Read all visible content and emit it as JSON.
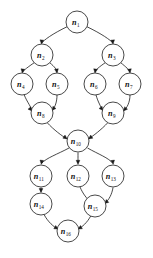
{
  "figure": {
    "header_text": "",
    "background_color": "#ffffff",
    "stroke_color": "#1a1a1a",
    "label_color": "#111111",
    "node_radius": 11,
    "width": 153,
    "height": 258
  },
  "chart_data": {
    "type": "diagram",
    "subtype": "directed-acyclic-graph",
    "directed": true,
    "node_count": 16,
    "edge_count": 18,
    "nodes": [
      {
        "id": "n1",
        "label_base": "n",
        "label_sub": "1",
        "x": 77,
        "y": 22
      },
      {
        "id": "n2",
        "label_base": "n",
        "label_sub": "2",
        "x": 42,
        "y": 55
      },
      {
        "id": "n3",
        "label_base": "n",
        "label_sub": "3",
        "x": 113,
        "y": 55
      },
      {
        "id": "n4",
        "label_base": "n",
        "label_sub": "4",
        "x": 22,
        "y": 84
      },
      {
        "id": "n5",
        "label_base": "n",
        "label_sub": "5",
        "x": 57,
        "y": 84
      },
      {
        "id": "n6",
        "label_base": "n",
        "label_sub": "6",
        "x": 95,
        "y": 84
      },
      {
        "id": "n7",
        "label_base": "n",
        "label_sub": "7",
        "x": 130,
        "y": 84
      },
      {
        "id": "n8",
        "label_base": "n",
        "label_sub": "8",
        "x": 42,
        "y": 113
      },
      {
        "id": "n9",
        "label_base": "n",
        "label_sub": "9",
        "x": 113,
        "y": 113
      },
      {
        "id": "n10",
        "label_base": "n",
        "label_sub": "10",
        "x": 78,
        "y": 141
      },
      {
        "id": "n11",
        "label_base": "n",
        "label_sub": "11",
        "x": 41,
        "y": 176
      },
      {
        "id": "n12",
        "label_base": "n",
        "label_sub": "12",
        "x": 78,
        "y": 176
      },
      {
        "id": "n13",
        "label_base": "n",
        "label_sub": "13",
        "x": 113,
        "y": 176
      },
      {
        "id": "n14",
        "label_base": "n",
        "label_sub": "14",
        "x": 41,
        "y": 204
      },
      {
        "id": "n15",
        "label_base": "n",
        "label_sub": "15",
        "x": 95,
        "y": 206
      },
      {
        "id": "n16",
        "label_base": "n",
        "label_sub": "16",
        "x": 68,
        "y": 231
      }
    ],
    "edges": [
      {
        "from": "n1",
        "to": "n2",
        "path": "M 67.5 26.5 C 52 34 44 40 41.5 43.2",
        "arrow_at": [
          41.5,
          44.0
        ],
        "arrow_angle": 95
      },
      {
        "from": "n1",
        "to": "n3",
        "path": "M 86.5 26.5 C 102 34 110.5 40 113 43.2",
        "arrow_at": [
          113,
          44.0
        ],
        "arrow_angle": 85
      },
      {
        "from": "n2",
        "to": "n4",
        "path": "M 34.5 62.5 C 28 67 24 70 22.3 72.2",
        "arrow_at": [
          22.3,
          73.0
        ],
        "arrow_angle": 98
      },
      {
        "from": "n2",
        "to": "n5",
        "path": "M 49.5 62.5 C 55 67 57 70 57 72.2",
        "arrow_at": [
          57,
          73.0
        ],
        "arrow_angle": 82
      },
      {
        "from": "n4",
        "to": "n8",
        "path": "M 24 94.5 C 27 102 32 108 31.5 110.5",
        "arrow_at": [
          32.0,
          111.0
        ],
        "arrow_angle": 50
      },
      {
        "from": "n5",
        "to": "n8",
        "path": "M 57 95 C 57 102 55 107 52.5 110",
        "arrow_at": [
          52.0,
          110.5
        ],
        "arrow_angle": 128
      },
      {
        "from": "n3",
        "to": "n6",
        "path": "M 105.5 62.5 C 99 67 95.5 70 95 72.2",
        "arrow_at": [
          95,
          73.0
        ],
        "arrow_angle": 98
      },
      {
        "from": "n3",
        "to": "n7",
        "path": "M 120.5 62.5 C 126 67 129.5 70 130 72.2",
        "arrow_at": [
          130,
          73.0
        ],
        "arrow_angle": 82
      },
      {
        "from": "n6",
        "to": "n9",
        "path": "M 96 95 C 98 102 101 107 102.5 110",
        "arrow_at": [
          103.0,
          110.5
        ],
        "arrow_angle": 52
      },
      {
        "from": "n7",
        "to": "n9",
        "path": "M 130 95 C 130 102 127 108 124 110.5",
        "arrow_at": [
          123.5,
          111.0
        ],
        "arrow_angle": 130
      },
      {
        "from": "n8",
        "to": "n10",
        "path": "M 47 122.5 C 54 130 62 136 66.5 138.5",
        "arrow_at": [
          67.2,
          138.9
        ],
        "arrow_angle": 35
      },
      {
        "from": "n9",
        "to": "n10",
        "path": "M 108 122.5 C 101 130 93 136 89 138.5",
        "arrow_at": [
          88.5,
          138.9
        ],
        "arrow_angle": 145
      },
      {
        "from": "n10",
        "to": "n11",
        "path": "M 69 148 C 58 154 46 158 41.5 163.5",
        "arrow_at": [
          41.3,
          164.3
        ],
        "arrow_angle": 98
      },
      {
        "from": "n10",
        "to": "n12",
        "path": "M 78 152.5 C 78 157 78 160 78 163.5",
        "arrow_at": [
          78,
          164.3
        ],
        "arrow_angle": 90
      },
      {
        "from": "n10",
        "to": "n13",
        "path": "M 87.5 148 C 98 154 109 158 113 163.5",
        "arrow_at": [
          113.2,
          164.3
        ],
        "arrow_angle": 82
      },
      {
        "from": "n11",
        "to": "n14",
        "path": "M 41 187.5 C 41 190 41 191.5 41 192",
        "arrow_at": [
          41,
          192.5
        ],
        "arrow_angle": 90
      },
      {
        "from": "n12",
        "to": "n15",
        "path": "M 80 187 C 83 194 87 199 90.5 201.5",
        "arrow_at": [
          91.0,
          202.0
        ],
        "arrow_angle": 48
      },
      {
        "from": "n13",
        "to": "n15",
        "path": "M 113 187.5 C 112 194 109 200 105 203",
        "arrow_at": [
          104.5,
          203.5
        ],
        "arrow_angle": 140
      },
      {
        "from": "n14",
        "to": "n16",
        "path": "M 44 214.5 C 48 222 54 227 57.5 228.8",
        "arrow_at": [
          58.2,
          229.1
        ],
        "arrow_angle": 30
      },
      {
        "from": "n15",
        "to": "n16",
        "path": "M 91 215.5 C 87 223 82 227 78.5 228.8",
        "arrow_at": [
          78.0,
          229.1
        ],
        "arrow_angle": 150
      }
    ]
  }
}
